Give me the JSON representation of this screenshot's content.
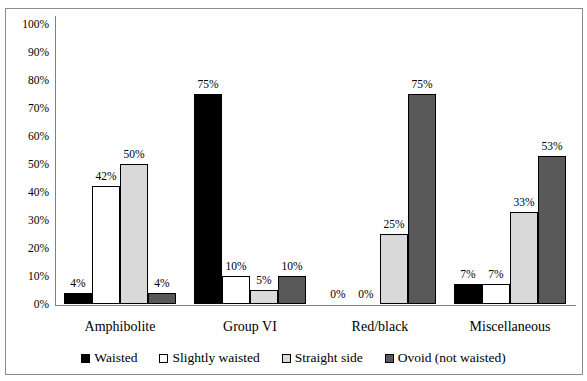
{
  "chart_data": {
    "type": "bar",
    "categories": [
      "Amphibolite",
      "Group VI",
      "Red/black",
      "Miscellaneous"
    ],
    "series": [
      {
        "name": "Waisted",
        "color": "#000000",
        "values": [
          4,
          75,
          0,
          7
        ]
      },
      {
        "name": "Slightly waisted",
        "color": "#ffffff",
        "values": [
          42,
          10,
          0,
          7
        ]
      },
      {
        "name": "Straight side",
        "color": "#d9d9d9",
        "values": [
          50,
          5,
          25,
          33
        ]
      },
      {
        "name": "Ovoid (not waisted)",
        "color": "#595959",
        "values": [
          4,
          10,
          75,
          53
        ]
      }
    ],
    "value_suffix": "%",
    "data_labels": true,
    "ylim": [
      0,
      100
    ],
    "ytick_step": 10,
    "ytick_suffix": "%",
    "grid": false,
    "legend_position": "bottom"
  },
  "colors": {
    "axis": "#808080",
    "bar_border": "#000000",
    "frame_border": "#8c8c8c",
    "background": "#ffffff",
    "text": "#000000"
  }
}
